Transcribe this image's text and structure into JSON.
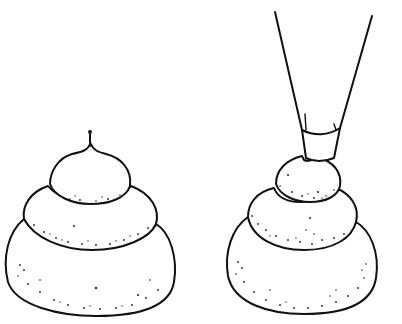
{
  "illustration": {
    "description": "Line drawing of two three-tiered piped choux/cream puff mounds; the right one shows a piping bag nozzle above it",
    "colors": {
      "ink": "#111111",
      "background": "#ffffff"
    },
    "figures": [
      {
        "name": "finished-mound",
        "tiers": 3,
        "has_peak_tip": true
      },
      {
        "name": "mound-being-piped",
        "tiers": 3,
        "has_piping_bag": true
      }
    ]
  }
}
